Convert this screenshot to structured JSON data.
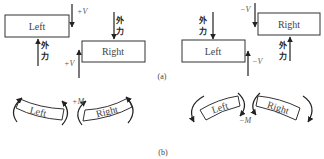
{
  "diagram": {
    "part_a": {
      "caption": "(a)",
      "positive_shear": {
        "left_box": "Left",
        "right_box": "Right",
        "shear_label_left": "+V",
        "shear_label_right": "+V",
        "external_force_left": "外力",
        "external_force_right": "外力",
        "external_force_left_lines": [
          "外",
          "力"
        ],
        "external_force_right_lines": [
          "外",
          "力"
        ]
      },
      "negative_shear": {
        "left_box": "Left",
        "right_box": "Right",
        "shear_label_left": "−V",
        "shear_label_right": "−V",
        "external_force_left_lines": [
          "外",
          "力"
        ],
        "external_force_right_lines": [
          "外",
          "力"
        ]
      }
    },
    "part_b": {
      "caption": "(b)",
      "positive_moment": {
        "left_segment": "Left",
        "right_segment": "Right",
        "moment_label": "+M"
      },
      "negative_moment": {
        "left_segment": "Left",
        "right_segment": "Right",
        "moment_label": "−M"
      }
    }
  }
}
